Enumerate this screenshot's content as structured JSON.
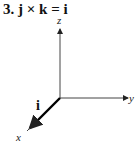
{
  "title": "3.  j × k = i",
  "diagram": {
    "axes": [
      {
        "name": "z",
        "label": "z"
      },
      {
        "name": "y",
        "label": "y"
      },
      {
        "name": "x",
        "label": "x"
      }
    ],
    "vector": {
      "label": "i",
      "direction": "x"
    },
    "colors": {
      "axis": "#333333",
      "vector": "#000000"
    }
  }
}
